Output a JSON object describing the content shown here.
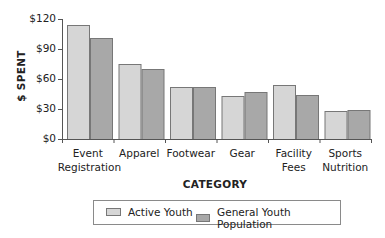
{
  "chart_data": {
    "type": "bar",
    "title": "",
    "xlabel": "CATEGORY",
    "ylabel": "$ SPENT",
    "ylim": [
      0,
      120
    ],
    "yticks": [
      "$0",
      "$30",
      "$60",
      "$90",
      "$120"
    ],
    "ytick_values": [
      0,
      30,
      60,
      90,
      120
    ],
    "grid": false,
    "legend_position": "bottom",
    "categories": [
      "Event\nRegistration",
      "Apparel",
      "Footwear",
      "Gear",
      "Facility\nFees",
      "Sports\nNutrition"
    ],
    "series": [
      {
        "name": "Active Youth",
        "color": "#d6d6d6",
        "values": [
          114,
          75,
          52,
          43,
          54,
          28
        ]
      },
      {
        "name": "General Youth Population",
        "color": "#a8a8a8",
        "values": [
          101,
          70,
          52,
          47,
          44,
          29
        ]
      }
    ]
  },
  "legend": {
    "items": [
      {
        "label": "Active Youth",
        "color": "#d6d6d6"
      },
      {
        "label": "General Youth Population",
        "color": "#a8a8a8"
      }
    ]
  },
  "labels": {
    "ylabel": "$ SPENT",
    "xlabel": "CATEGORY"
  }
}
